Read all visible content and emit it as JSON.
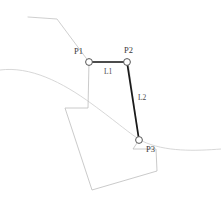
{
  "diagram": {
    "width": 221,
    "height": 217,
    "background_color": "#ffffff",
    "type": "parcel-survey-line-diagram",
    "colors": {
      "active_path": "#1a1a1a",
      "parcel_outline": "#b9b9b9",
      "terrain_line": "#cfcfcf",
      "marker_fill": "#ffffff",
      "marker_stroke": "#555555",
      "label_text": "#3a3a3a"
    },
    "vertices": [
      {
        "id": "P1",
        "label": "P1",
        "x": 89,
        "y": 62,
        "label_x": 74,
        "label_y": 54
      },
      {
        "id": "P2",
        "label": "P2",
        "x": 127,
        "y": 62,
        "label_x": 124,
        "label_y": 53
      },
      {
        "id": "P3",
        "label": "P3",
        "x": 139,
        "y": 140,
        "label_x": 146,
        "label_y": 152
      }
    ],
    "segments": [
      {
        "id": "L1",
        "label": "L1",
        "from": "P1",
        "to": "P2",
        "label_x": 104,
        "label_y": 74
      },
      {
        "id": "L2",
        "label": "L2",
        "from": "P2",
        "to": "P3",
        "label_x": 138,
        "label_y": 100
      }
    ],
    "active_path_points": "89,62 127,62 139,140",
    "parcel_outline_points": "65,108 88,108 89,62 89,62",
    "parcel_polygon_points": "65,108 88,108 89,62 128,62 139,140 133,149 156,149 157,171 92,190 65,108",
    "terrain_top_line_points": "28,17 57,19 89,62",
    "terrain_curve_path": "M 0,70 C 30,66 62,82 92,104 C 118,123 130,134 142,141 C 165,152 195,151 221,149",
    "marker_radius": 3.4
  }
}
